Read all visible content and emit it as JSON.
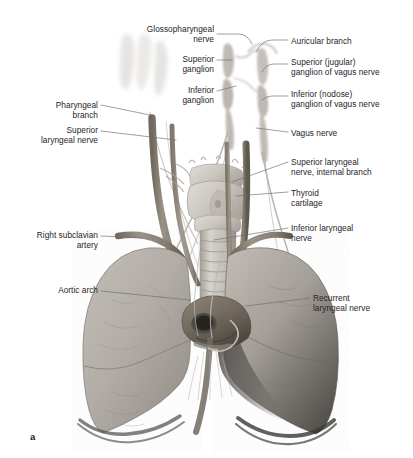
{
  "figure": {
    "panel_label": "a",
    "background_color": "#ffffff",
    "leader_line_color": "#6c6a72",
    "text_color": "#262429"
  },
  "labels": {
    "left": [
      {
        "id": "pharyngeal-branch",
        "text": "Pharyngeal\nbranch",
        "align": "right",
        "x": 10,
        "y": 100,
        "width": 88
      },
      {
        "id": "superior-laryngeal-nerve",
        "text": "Superior\nlaryngeal nerve",
        "align": "right",
        "x": 10,
        "y": 125,
        "width": 88
      },
      {
        "id": "right-subclavian-artery",
        "text": "Right subclavian\nartery",
        "align": "right",
        "x": 10,
        "y": 230,
        "width": 88
      },
      {
        "id": "aortic-arch",
        "text": "Aortic arch",
        "align": "right",
        "x": 10,
        "y": 285,
        "width": 88
      }
    ],
    "center": [
      {
        "id": "glossopharyngeal-nerve",
        "text": "Glossopharyngeal\nnerve",
        "align": "right",
        "x": 124,
        "y": 24,
        "width": 90
      },
      {
        "id": "superior-ganglion",
        "text": "Superior\nganglion",
        "align": "right",
        "x": 124,
        "y": 54,
        "width": 90
      },
      {
        "id": "inferior-ganglion",
        "text": "Inferior\nganglion",
        "align": "right",
        "x": 124,
        "y": 85,
        "width": 90
      }
    ],
    "right": [
      {
        "id": "auricular-branch",
        "text": "Auricular branch",
        "align": "left",
        "x": 291,
        "y": 36,
        "width": 120
      },
      {
        "id": "superior-jugular-ganglion-of-vagus-nerve",
        "text": "Superior (jugular)\nganglion of vagus nerve",
        "align": "left",
        "x": 291,
        "y": 57,
        "width": 122
      },
      {
        "id": "inferior-nodose-ganglion-of-vagus-nerve",
        "text": "Inferior (nodose)\nganglion of vagus nerve",
        "align": "left",
        "x": 291,
        "y": 89,
        "width": 122
      },
      {
        "id": "vagus-nerve",
        "text": "Vagus nerve",
        "align": "left",
        "x": 291,
        "y": 128,
        "width": 120
      },
      {
        "id": "superior-laryngeal-nerve-internal-branch",
        "text": "Superior laryngeal\nnerve, internal branch",
        "align": "left",
        "x": 291,
        "y": 157,
        "width": 122
      },
      {
        "id": "thyroid-cartilage",
        "text": "Thyroid\ncartilage",
        "align": "left",
        "x": 291,
        "y": 188,
        "width": 120
      },
      {
        "id": "inferior-laryngeal-nerve",
        "text": "Inferior laryngeal\nnerve",
        "align": "left",
        "x": 291,
        "y": 223,
        "width": 120
      },
      {
        "id": "recurrent-laryngeal-nerve",
        "text": "Recurrent\nlaryngeal nerve",
        "align": "left",
        "x": 313,
        "y": 293,
        "width": 100
      }
    ]
  },
  "anatomy": {
    "structures": [
      "skull-base",
      "glossopharyngeal-nerve",
      "vagus-nerve-trunk",
      "superior-ganglion",
      "inferior-ganglion",
      "larynx",
      "thyroid-cartilage",
      "trachea",
      "right-lung",
      "left-lung",
      "aortic-arch",
      "right-subclavian-artery",
      "recurrent-laryngeal-nerve",
      "common-carotid-artery"
    ],
    "palette": {
      "lung_light": "#b9b5ae",
      "lung_mid": "#9b968f",
      "lung_dark": "#5d5a57",
      "lung_shadow": "#3a3836",
      "cartilage": "#cfcac4",
      "cartilage_shade": "#a9a49e",
      "vessel": "#8a8276",
      "vessel_dark": "#6a6356",
      "nerve": "#b5b0a6",
      "bone": "#dcd9d4"
    }
  }
}
